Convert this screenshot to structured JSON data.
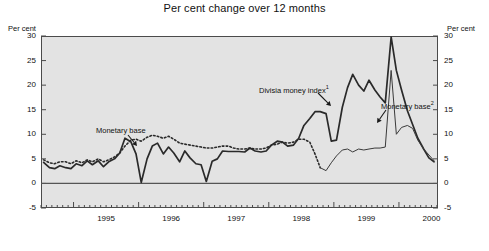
{
  "chart_data": {
    "type": "line",
    "title": "Per cent change over 12 months",
    "xlabel": "",
    "ylabel": "Per cent",
    "ylabel_right": "Per cent",
    "ylim": [
      -5,
      30
    ],
    "yticks": [
      30,
      25,
      20,
      15,
      10,
      5,
      0,
      -5
    ],
    "xlim": [
      1994.5,
      2000.6
    ],
    "xticks": [
      1995,
      1996,
      1997,
      1998,
      1999,
      2000
    ],
    "xtick_labels": [
      "1995",
      "1996",
      "1997",
      "1998",
      "1999",
      "2000"
    ],
    "minor_tick_interval_months": 1,
    "grid": false,
    "legend": "none",
    "zero_line": 0,
    "plot_background": "#e3e3e3",
    "series": [
      {
        "name": "Divisia money index",
        "style": "solid-thick",
        "color": "#2a2a2a",
        "x": [
          1994.54,
          1994.63,
          1994.71,
          1994.79,
          1994.88,
          1994.96,
          1995.04,
          1995.13,
          1995.21,
          1995.29,
          1995.38,
          1995.46,
          1995.54,
          1995.63,
          1995.71,
          1995.79,
          1995.88,
          1995.96,
          1996.04,
          1996.13,
          1996.21,
          1996.29,
          1996.38,
          1996.46,
          1996.54,
          1996.63,
          1996.71,
          1996.79,
          1996.88,
          1996.96,
          1997.04,
          1997.13,
          1997.21,
          1997.29,
          1997.38,
          1997.46,
          1997.54,
          1997.63,
          1997.71,
          1997.79,
          1997.88,
          1997.96,
          1998.04,
          1998.13,
          1998.21,
          1998.29,
          1998.38,
          1998.46,
          1998.54,
          1998.63,
          1998.71,
          1998.79,
          1998.88,
          1998.96,
          1999.04,
          1999.13,
          1999.21,
          1999.29,
          1999.38,
          1999.46,
          1999.54,
          1999.63,
          1999.71,
          1999.79,
          1999.88,
          1999.96,
          2000.04,
          2000.13,
          2000.21,
          2000.29,
          2000.38,
          2000.46,
          2000.54
        ],
        "values": [
          4.3,
          3.2,
          3.0,
          3.6,
          3.2,
          3.0,
          4.0,
          3.6,
          4.6,
          3.8,
          4.6,
          3.4,
          4.4,
          5.0,
          6.2,
          9.2,
          8.5,
          6.0,
          0.2,
          5.0,
          7.6,
          8.2,
          6.0,
          7.4,
          6.2,
          4.4,
          6.6,
          5.2,
          4.0,
          3.8,
          0.4,
          4.5,
          5.0,
          6.6,
          6.5,
          6.5,
          6.5,
          6.4,
          7.2,
          6.6,
          6.4,
          6.6,
          7.8,
          8.6,
          8.4,
          7.6,
          7.8,
          9.2,
          11.8,
          13.2,
          14.6,
          14.6,
          14.2,
          8.6,
          8.8,
          15.5,
          19.5,
          22.2,
          20.0,
          18.8,
          21.0,
          19.0,
          17.6,
          16.4,
          29.8,
          23.0,
          19.0,
          14.8,
          12.0,
          9.2,
          7.0,
          5.2,
          4.4
        ]
      },
      {
        "name": "Monetary base",
        "style": "dotted",
        "color": "#2a2a2a",
        "x": [
          1994.54,
          1994.63,
          1994.71,
          1994.79,
          1994.88,
          1994.96,
          1995.04,
          1995.13,
          1995.21,
          1995.29,
          1995.38,
          1995.46,
          1995.54,
          1995.63,
          1995.71,
          1995.79,
          1995.88,
          1995.96,
          1996.04,
          1996.13,
          1996.21,
          1996.29,
          1996.38,
          1996.46,
          1996.54,
          1996.63,
          1996.71,
          1996.79,
          1996.88,
          1996.96,
          1997.04,
          1997.13,
          1997.21,
          1997.29,
          1997.38,
          1997.46,
          1997.54,
          1997.63,
          1997.71,
          1997.79,
          1997.88,
          1997.96,
          1998.04,
          1998.13,
          1998.21,
          1998.29,
          1998.38,
          1998.46,
          1998.54,
          1998.63,
          1998.71,
          1998.79
        ],
        "values": [
          4.8,
          4.2,
          4.0,
          4.4,
          4.4,
          4.0,
          4.6,
          4.2,
          4.8,
          4.4,
          5.0,
          4.4,
          4.8,
          5.4,
          6.2,
          7.6,
          8.8,
          9.0,
          8.6,
          9.4,
          9.8,
          9.6,
          9.2,
          9.6,
          9.0,
          8.2,
          8.0,
          7.8,
          7.6,
          7.4,
          7.2,
          7.2,
          7.4,
          7.6,
          7.6,
          7.2,
          7.0,
          7.0,
          7.2,
          7.0,
          7.0,
          7.2,
          7.8,
          8.0,
          8.4,
          8.2,
          8.4,
          9.0,
          9.0,
          8.4,
          6.0,
          3.2
        ]
      },
      {
        "name": "Monetary base",
        "style": "solid-thin",
        "color": "#3a3a3a",
        "x": [
          1998.79,
          1998.88,
          1998.96,
          1999.04,
          1999.13,
          1999.21,
          1999.29,
          1999.38,
          1999.46,
          1999.54,
          1999.63,
          1999.71,
          1999.79,
          1999.88,
          1999.96,
          2000.04,
          2000.13,
          2000.21,
          2000.29,
          2000.38,
          2000.46,
          2000.54
        ],
        "values": [
          3.2,
          2.6,
          4.2,
          5.6,
          6.8,
          7.0,
          6.4,
          7.0,
          6.8,
          7.0,
          7.2,
          7.2,
          7.4,
          23.0,
          10.0,
          11.4,
          11.8,
          11.2,
          8.8,
          7.0,
          5.8,
          4.6
        ]
      }
    ],
    "annotations": [
      {
        "id": "monetary-base-1",
        "text": "Monetary base",
        "superscript": "",
        "label_x": 96,
        "label_y": 126,
        "arrow_from_x": 128,
        "arrow_from_y": 135,
        "arrow_to_x": 137,
        "arrow_to_y": 146
      },
      {
        "id": "divisia-money-index",
        "text": "Divisia money index",
        "superscript": "1",
        "label_x": 259,
        "label_y": 84,
        "arrow_from_x": 318,
        "arrow_from_y": 93,
        "arrow_to_x": 331,
        "arrow_to_y": 106
      },
      {
        "id": "monetary-base-2",
        "text": "Monetary base",
        "superscript": "2",
        "label_x": 381,
        "label_y": 100,
        "arrow_from_x": 386,
        "arrow_from_y": 110,
        "arrow_to_x": 377,
        "arrow_to_y": 123
      }
    ]
  }
}
